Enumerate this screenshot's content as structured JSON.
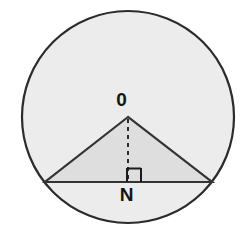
{
  "figure": {
    "kind": "geometry-diagram",
    "canvas": {
      "width": 245,
      "height": 237,
      "background": "#ffffff"
    },
    "colors": {
      "circle_fill": "#ececec",
      "circle_stroke": "#2b2b2b",
      "triangle_fill": "#dedede",
      "triangle_stroke": "#333333",
      "chord_stroke": "#333333",
      "dashed_stroke": "#2b2b2b",
      "right_angle_stroke": "#1c1c1c",
      "label_color": "#141414"
    },
    "circle": {
      "name": "circle",
      "center_x": 128,
      "center_y": 117,
      "radius": 106,
      "stroke_width": 2.2
    },
    "chord": {
      "name": "chord",
      "x1": 45,
      "y1": 182,
      "x2": 212,
      "y2": 182,
      "stroke_width": 2.2
    },
    "triangle": {
      "name": "inscribed-triangle",
      "points": "128,117 45,182 212,182",
      "apex_x": 128,
      "apex_y": 117,
      "stroke_width": 2.2
    },
    "height_segment": {
      "name": "perpendicular-height",
      "x1": 128,
      "y1": 119,
      "x2": 128,
      "y2": 182,
      "stroke_width": 2,
      "dash_pattern": "4,4"
    },
    "right_angle_marker": {
      "name": "right-angle-marker",
      "x": 127,
      "y": 168,
      "size": 14,
      "stroke_width": 2,
      "path": "M127,168 L127,182 M127,168.6 L141,168.6 M141,168 L141,182"
    },
    "labels": {
      "center_point": "0",
      "foot_point": "N"
    }
  }
}
